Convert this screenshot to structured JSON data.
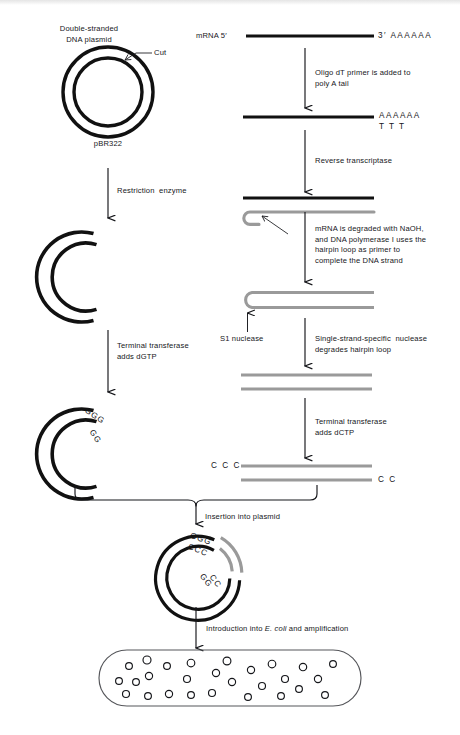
{
  "figure": {
    "colors": {
      "ink": "#15161a",
      "dna_black": "#111111",
      "cdna_gray": "#9a9a9a",
      "outline": "#55565a",
      "background": "#ffffff"
    }
  },
  "left_column": {
    "plasmid_label_line1": "Double-stranded",
    "plasmid_label_line2": "DNA plasmid",
    "cut_label": "Cut",
    "plasmid_name": "pBR322",
    "step1_label": "Restriction  enzyme",
    "step2_label_line1": "Terminal transferase",
    "step2_label_line2": "adds dGTP",
    "tail_outer": "GGG",
    "tail_inner": "GG"
  },
  "right_column": {
    "mrna_label": "mRNA 5′",
    "mrna_three_prime": "3′ AAAAAA",
    "step1_label_line1": "Oligo dT primer is added to",
    "step1_label_line2": "poly A tail",
    "polyA": "AAAAAA",
    "oligo_dT": "T T T",
    "step2_label": "Reverse transcriptase",
    "step3_label_line1": "mRNA is degraded with NaOH,",
    "step3_label_line2": "and DNA polymerase I uses the",
    "step3_label_line3": "hairpin loop as primer to",
    "step3_label_line4": "complete the DNA strand",
    "s1_nuclease_label": "S1 nuclease",
    "step4_label_line1": "Single-strand-specific  nuclease",
    "step4_label_line2": "degrades hairpin loop",
    "step5_label_line1": "Terminal transferase",
    "step5_label_line2": "adds dCTP",
    "tail_left": "C C C",
    "tail_right": "C C"
  },
  "merge": {
    "insertion_label": "Insertion into plasmid"
  },
  "recombinant": {
    "tail_ggg": "GGG",
    "tail_ccc": "CCC",
    "tail_gg": "GG",
    "tail_cc": "CC"
  },
  "bacterium": {
    "label_prefix": "Introduction into ",
    "label_italic": "E. coli",
    "label_suffix": " and amplification",
    "plasmid_copies": 27
  }
}
